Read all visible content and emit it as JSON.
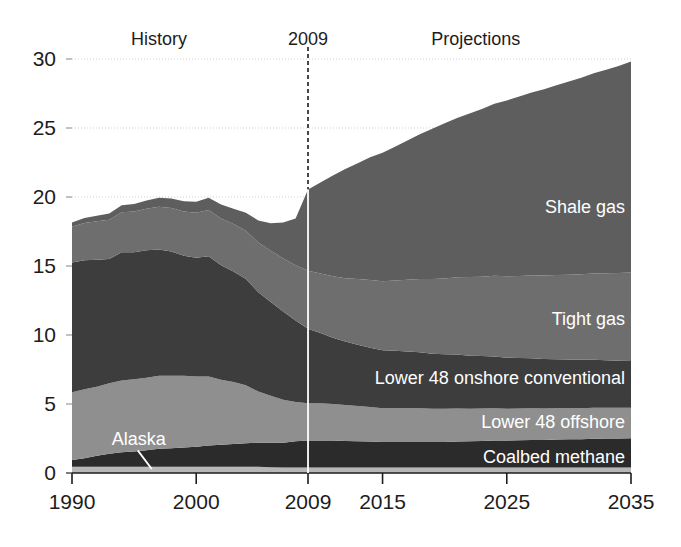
{
  "chart_data": {
    "type": "area",
    "stacked": true,
    "title": "",
    "subtitle": "",
    "xlabel": "",
    "ylabel": "",
    "xlim": [
      1990,
      2035
    ],
    "ylim": [
      0,
      30
    ],
    "ytick_values": [
      0,
      5,
      10,
      15,
      20,
      25,
      30
    ],
    "ytick_labels": [
      "0",
      "5",
      "10",
      "15",
      "20",
      "25",
      "30"
    ],
    "xtick_values": [
      1990,
      2000,
      2009,
      2015,
      2025,
      2035
    ],
    "xtick_labels": [
      "1990",
      "2000",
      "2009",
      "2015",
      "2025",
      "2035"
    ],
    "grid": "horizontal-dotted",
    "legend_position": "inline-on-bands",
    "annotations": [
      {
        "name": "history-label",
        "text": "History",
        "x": 1997.0,
        "y": 31.0
      },
      {
        "name": "year-divider-label",
        "text": "2009",
        "x": 2009,
        "y": 31.0
      },
      {
        "name": "projections-label",
        "text": "Projections",
        "x": 2022.5,
        "y": 31.0
      },
      {
        "name": "alaska-callout",
        "text": "Alaska",
        "x": 1993.2,
        "y": 2.0
      }
    ],
    "divider": {
      "name": "year-2009-divider",
      "x": 2009,
      "style": "dashed-vertical"
    },
    "x": [
      1990,
      1991,
      1992,
      1993,
      1994,
      1995,
      1996,
      1997,
      1998,
      1999,
      2000,
      2001,
      2002,
      2003,
      2004,
      2005,
      2006,
      2007,
      2008,
      2009,
      2010,
      2011,
      2012,
      2013,
      2014,
      2015,
      2016,
      2017,
      2018,
      2019,
      2020,
      2021,
      2022,
      2023,
      2024,
      2025,
      2026,
      2027,
      2028,
      2029,
      2030,
      2031,
      2032,
      2033,
      2034,
      2035
    ],
    "series": [
      {
        "name": "Alaska",
        "label": "Alaska",
        "color": "#b7b7b7",
        "values": [
          0.45,
          0.45,
          0.45,
          0.45,
          0.45,
          0.45,
          0.45,
          0.45,
          0.45,
          0.45,
          0.45,
          0.45,
          0.45,
          0.45,
          0.45,
          0.45,
          0.42,
          0.4,
          0.4,
          0.4,
          0.4,
          0.4,
          0.4,
          0.4,
          0.4,
          0.4,
          0.4,
          0.4,
          0.4,
          0.4,
          0.4,
          0.4,
          0.4,
          0.4,
          0.4,
          0.4,
          0.4,
          0.4,
          0.4,
          0.4,
          0.4,
          0.4,
          0.4,
          0.4,
          0.4,
          0.4
        ]
      },
      {
        "name": "Coalbed methane",
        "label": "Coalbed methane",
        "color": "#2b2b2b",
        "values": [
          0.5,
          0.62,
          0.8,
          0.95,
          1.05,
          1.1,
          1.2,
          1.3,
          1.35,
          1.4,
          1.45,
          1.55,
          1.6,
          1.65,
          1.7,
          1.75,
          1.78,
          1.8,
          1.9,
          1.95,
          1.95,
          1.95,
          1.92,
          1.9,
          1.88,
          1.85,
          1.85,
          1.85,
          1.85,
          1.85,
          1.85,
          1.88,
          1.9,
          1.92,
          1.95,
          1.95,
          1.98,
          2.0,
          2.0,
          2.02,
          2.05,
          2.05,
          2.08,
          2.1,
          2.1,
          2.12
        ]
      },
      {
        "name": "Lower 48 offshore",
        "label": "Lower 48 offshore",
        "color": "#8f8f8f",
        "values": [
          4.9,
          5.0,
          5.0,
          5.1,
          5.2,
          5.25,
          5.25,
          5.3,
          5.25,
          5.2,
          5.1,
          5.0,
          4.7,
          4.5,
          4.2,
          3.7,
          3.4,
          3.1,
          2.85,
          2.7,
          2.7,
          2.65,
          2.6,
          2.55,
          2.5,
          2.45,
          2.45,
          2.45,
          2.45,
          2.4,
          2.4,
          2.4,
          2.35,
          2.35,
          2.35,
          2.3,
          2.3,
          2.3,
          2.28,
          2.28,
          2.25,
          2.25,
          2.25,
          2.22,
          2.22,
          2.2
        ]
      },
      {
        "name": "Lower 48 onshore conventional",
        "label": "Lower 48 onshore conventional",
        "color": "#3d3d3d",
        "values": [
          9.4,
          9.35,
          9.2,
          9.0,
          9.3,
          9.2,
          9.25,
          9.15,
          9.0,
          8.7,
          8.6,
          8.7,
          8.3,
          8.0,
          7.7,
          7.2,
          6.8,
          6.4,
          5.9,
          5.4,
          5.1,
          4.8,
          4.6,
          4.45,
          4.3,
          4.2,
          4.15,
          4.1,
          4.05,
          4.0,
          3.95,
          3.9,
          3.85,
          3.8,
          3.75,
          3.7,
          3.65,
          3.62,
          3.58,
          3.55,
          3.52,
          3.5,
          3.48,
          3.45,
          3.42,
          3.4
        ]
      },
      {
        "name": "Tight gas",
        "label": "Tight gas",
        "color": "#6e6e6e",
        "values": [
          2.6,
          2.7,
          2.8,
          2.85,
          2.9,
          2.95,
          3.0,
          3.1,
          3.15,
          3.2,
          3.25,
          3.35,
          3.4,
          3.45,
          3.5,
          3.6,
          3.7,
          3.85,
          4.0,
          4.2,
          4.3,
          4.45,
          4.6,
          4.75,
          4.9,
          5.0,
          5.1,
          5.2,
          5.3,
          5.4,
          5.5,
          5.6,
          5.7,
          5.75,
          5.85,
          5.9,
          5.95,
          6.0,
          6.05,
          6.1,
          6.15,
          6.2,
          6.25,
          6.3,
          6.35,
          6.4
        ]
      },
      {
        "name": "Shale gas",
        "label": "Shale gas",
        "color": "#5e5e5e",
        "values": [
          0.3,
          0.35,
          0.4,
          0.45,
          0.5,
          0.55,
          0.6,
          0.65,
          0.7,
          0.75,
          0.8,
          0.9,
          1.0,
          1.1,
          1.3,
          1.6,
          2.0,
          2.6,
          3.4,
          5.9,
          6.6,
          7.3,
          7.9,
          8.4,
          8.9,
          9.3,
          9.7,
          10.1,
          10.5,
          10.9,
          11.25,
          11.55,
          11.85,
          12.15,
          12.45,
          12.75,
          13.0,
          13.25,
          13.5,
          13.75,
          14.0,
          14.25,
          14.5,
          14.75,
          15.0,
          15.3
        ]
      }
    ]
  },
  "axes": {
    "y_axis_name": "vertical-axis",
    "x_axis_name": "horizontal-axis"
  }
}
